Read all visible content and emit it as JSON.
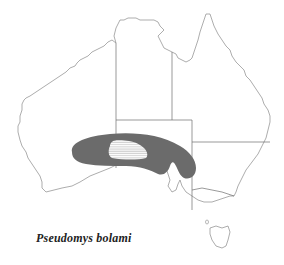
{
  "map": {
    "title": "Pseudomys bolami",
    "region": "Australia",
    "colors": {
      "coastline": "#8a8a8a",
      "borders": "#6e6e6e",
      "range_fill": "#6b6b6b",
      "hatch_fill": "#ffffff",
      "hatch_lines": "#9a9a9a",
      "caption": "#222222"
    },
    "legend": {
      "range_shaded": "Distribution range",
      "range_hatched": "Core area (hatched)"
    }
  }
}
